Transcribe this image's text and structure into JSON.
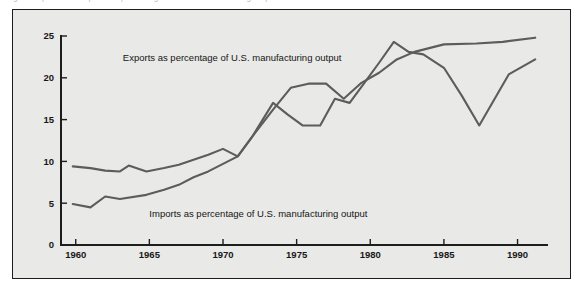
{
  "top_caption": {
    "text": "Figure    Exports and imports as percentages of U.S. manufacturing output",
    "note": "clipped-illegible"
  },
  "chart_data": {
    "type": "line",
    "title": "",
    "xlabel": "",
    "ylabel": "",
    "xlim": [
      1959,
      1992
    ],
    "ylim": [
      0,
      25
    ],
    "grid": false,
    "legend_position": "inline-annotation",
    "x_ticks": [
      1960,
      1965,
      1970,
      1975,
      1980,
      1985,
      1990
    ],
    "y_ticks": [
      0,
      5,
      10,
      15,
      20,
      25
    ],
    "line_color": "#5c5c5c",
    "background_color": "#e9e9e7",
    "frame_color": "#1d1d1d",
    "annotations": [
      {
        "id": "exports-label",
        "text": "Exports as percentage of U.S. manufacturing output",
        "x": 1963.2,
        "y": 22.0
      },
      {
        "id": "imports-label",
        "text": "Imports as percentage of U.S. manufacturing output",
        "x": 1965.0,
        "y": 3.4
      }
    ],
    "series": [
      {
        "name": "Exports as percentage of U.S. manufacturing output",
        "x": [
          1959.8,
          1961,
          1962,
          1963,
          1963.6,
          1964.8,
          1966,
          1967,
          1968,
          1969,
          1970,
          1971,
          1972,
          1973.4,
          1974.4,
          1975.4,
          1976.6,
          1977.6,
          1978.6,
          1979.6,
          1980.6,
          1981.6,
          1982.6,
          1983.6,
          1985,
          1986.2,
          1987.4,
          1989.4,
          1991.2
        ],
        "values": [
          9.4,
          9.2,
          8.9,
          8.8,
          9.5,
          8.8,
          9.2,
          9.6,
          10.2,
          10.8,
          11.5,
          10.6,
          13.0,
          17.0,
          15.6,
          14.3,
          14.3,
          17.5,
          17.0,
          19.4,
          21.8,
          24.3,
          23.1,
          22.8,
          21.2,
          17.9,
          14.3,
          20.4,
          22.2
        ]
      },
      {
        "name": "Imports as percentage of U.S. manufacturing output",
        "x": [
          1959.8,
          1961,
          1962,
          1963,
          1964.8,
          1966,
          1967,
          1968,
          1969,
          1970,
          1971,
          1972,
          1973.4,
          1974.6,
          1975.8,
          1977,
          1978.2,
          1979.4,
          1980.6,
          1981.8,
          1983,
          1985,
          1987.2,
          1989,
          1991.2
        ],
        "values": [
          4.9,
          4.5,
          5.8,
          5.5,
          6.0,
          6.6,
          7.2,
          8.1,
          8.8,
          9.7,
          10.6,
          13.0,
          16.2,
          18.8,
          19.3,
          19.3,
          17.5,
          19.4,
          20.6,
          22.2,
          23.1,
          24.0,
          24.1,
          24.3,
          24.8
        ]
      }
    ]
  }
}
